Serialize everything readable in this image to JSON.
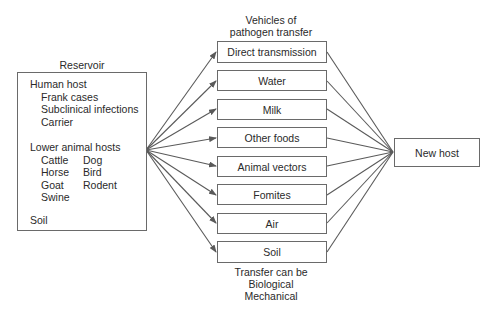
{
  "reservoir": {
    "title": "Reservoir",
    "human_host": {
      "label": "Human host",
      "items": [
        "Frank cases",
        "Subclinical infections",
        "Carrier"
      ]
    },
    "lower_animal_hosts": {
      "label": "Lower animal hosts",
      "col1": [
        "Cattle",
        "Horse",
        "Goat",
        "Swine"
      ],
      "col2": [
        "Dog",
        "Bird",
        "Rodent"
      ]
    },
    "soil": "Soil"
  },
  "vehicles": {
    "title_line1": "Vehicles of",
    "title_line2": "pathogen transfer",
    "items": [
      {
        "label": "Direct transmission"
      },
      {
        "label": "Water"
      },
      {
        "label": "Milk"
      },
      {
        "label": "Other foods"
      },
      {
        "label": "Animal vectors"
      },
      {
        "label": "Fomites"
      },
      {
        "label": "Air"
      },
      {
        "label": "Soil"
      }
    ],
    "footer": [
      "Transfer can be",
      "Biological",
      "Mechanical"
    ]
  },
  "destination": {
    "label": "New host"
  },
  "colors": {
    "line": "#5a5a5a",
    "border": "#6a6a6a",
    "text": "#2a2a2a"
  }
}
